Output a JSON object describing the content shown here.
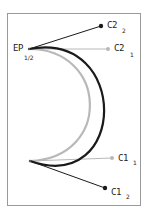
{
  "diagram": {
    "type": "bezier-control-points",
    "colors": {
      "frame": "#9a9a9a",
      "curve_1": "#b8b8b8",
      "curve_2": "#1a1a1a",
      "background": "#ffffff"
    },
    "labels": {
      "endpoint": {
        "main": "EP",
        "sub": "1/2"
      },
      "c2_2": {
        "main": "C2",
        "sub": "2"
      },
      "c2_1": {
        "main": "C2",
        "sub": "1"
      },
      "c1_1": {
        "main": "C1",
        "sub": "1"
      },
      "c1_2": {
        "main": "C1",
        "sub": "2"
      }
    },
    "points": {
      "ep_top": [
        29,
        49
      ],
      "ep_bottom": [
        30,
        161
      ],
      "c2_2": [
        101,
        26
      ],
      "c2_1": [
        108,
        49
      ],
      "c1_1": [
        112,
        158
      ],
      "c1_2": [
        105,
        188
      ]
    }
  }
}
